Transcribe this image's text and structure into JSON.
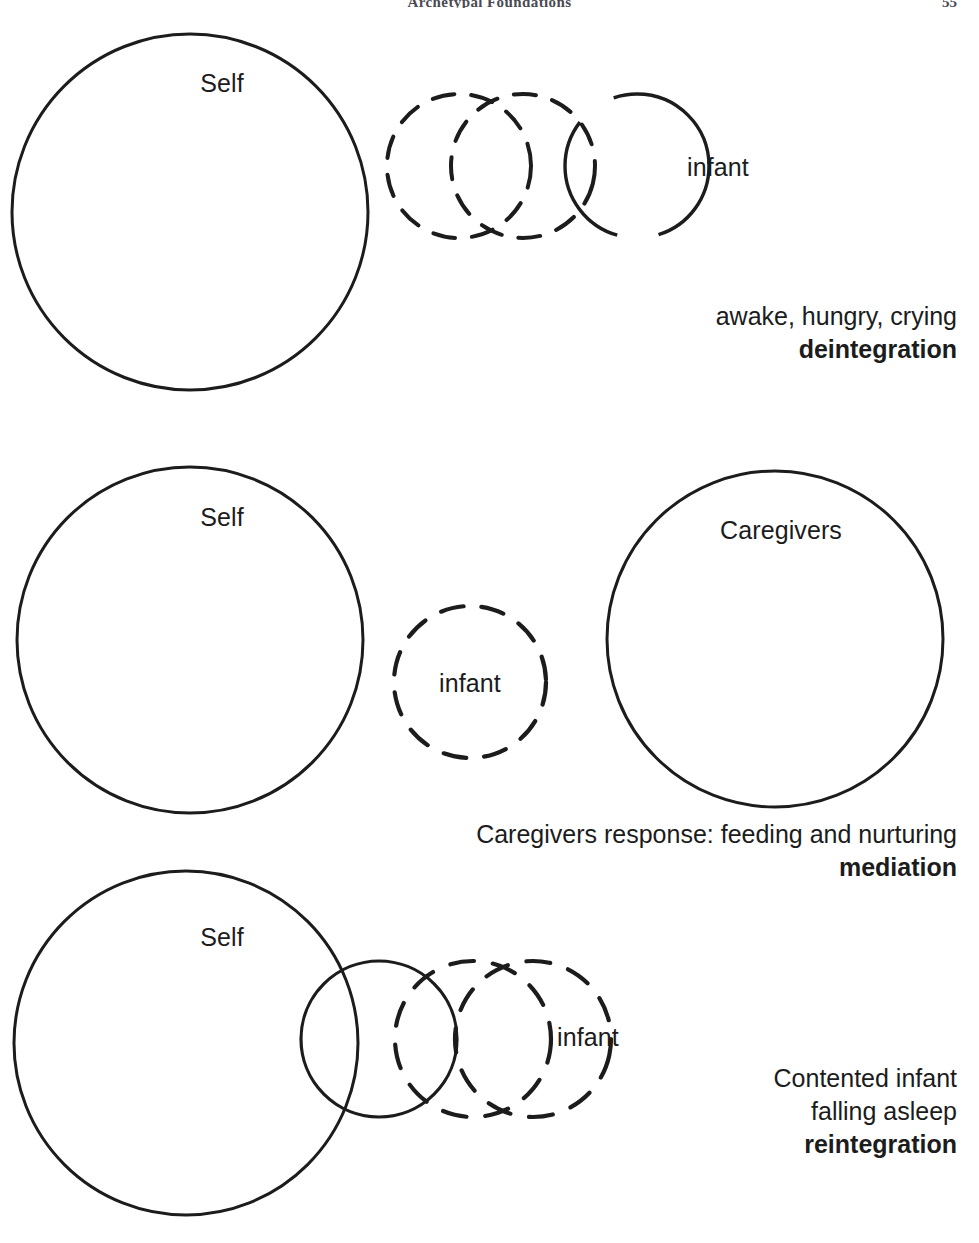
{
  "running_head": {
    "title": "Archetypal Foundations",
    "page_number": "55"
  },
  "figure": {
    "panels": [
      {
        "id": "panel-deintegration",
        "circles": [
          {
            "name": "self-circle",
            "label": "Self",
            "style": "solid",
            "cx": 190,
            "cy": 212,
            "r": 178,
            "label_x": 222,
            "label_y": 83
          },
          {
            "name": "infant-trail-circle-1",
            "label": "",
            "style": "dashed",
            "cx": 459,
            "cy": 166,
            "r": 72,
            "label_x": 0,
            "label_y": 0
          },
          {
            "name": "infant-trail-circle-2",
            "label": "",
            "style": "dashed",
            "cx": 523,
            "cy": 166,
            "r": 72,
            "label_x": 0,
            "label_y": 0
          },
          {
            "name": "infant-circle",
            "label": "infant",
            "style": "gapped",
            "cx": 637,
            "cy": 166,
            "r": 72,
            "label_x": 718,
            "label_y": 167
          }
        ],
        "caption": {
          "line1": "awake, hungry, crying",
          "line2": "deintegration"
        }
      },
      {
        "id": "panel-mediation",
        "circles": [
          {
            "name": "self-circle",
            "label": "Caregivers",
            "style": "solid",
            "cx": 190,
            "cy": 640,
            "r": 173,
            "label_x": 222,
            "label_y": 517
          },
          {
            "name": "infant-circle",
            "label": "infant",
            "style": "dashed",
            "cx": 470,
            "cy": 682,
            "r": 76,
            "label_x": 470,
            "label_y": 683
          },
          {
            "name": "caregivers-circle",
            "label": "Caregivers",
            "style": "solid",
            "cx": 775,
            "cy": 639,
            "r": 168,
            "label_x": 781,
            "label_y": 530
          }
        ],
        "self_label": "Self",
        "caption": {
          "line1": "Caregivers response: feeding and nurturing",
          "line2": "mediation"
        }
      },
      {
        "id": "panel-reintegration",
        "circles": [
          {
            "name": "self-circle",
            "label": "Self",
            "style": "solid",
            "cx": 186,
            "cy": 1043,
            "r": 172,
            "label_x": 222,
            "label_y": 937
          },
          {
            "name": "infant-circle",
            "label": "",
            "style": "solid",
            "cx": 379,
            "cy": 1039,
            "r": 78,
            "label_x": 0,
            "label_y": 0
          },
          {
            "name": "infant-trail-circle-1",
            "label": "",
            "style": "dashed",
            "cx": 473,
            "cy": 1039,
            "r": 78,
            "label_x": 0,
            "label_y": 0
          },
          {
            "name": "infant-trail-circle-2",
            "label": "infant",
            "style": "dashed",
            "cx": 533,
            "cy": 1039,
            "r": 78,
            "label_x": 588,
            "label_y": 1037
          }
        ],
        "caption": {
          "line1": "Contented infant",
          "line2": "falling asleep",
          "line3": "reintegration"
        }
      }
    ]
  },
  "colors": {
    "stroke": "#1c1c1c",
    "background": "#ffffff",
    "text": "#1c1c1c",
    "runhead": "#4a4a52"
  }
}
